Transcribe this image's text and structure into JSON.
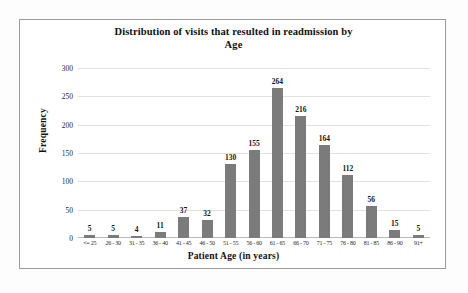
{
  "chart_data": {
    "type": "bar",
    "title": "Distribution of visits that resulted in readmission by Age",
    "title_line1": "Distribution of visits that resulted in readmission by",
    "title_line2": "Age",
    "xlabel": "Patient Age (in years)",
    "ylabel": "Frequency",
    "categories": [
      "<= 25",
      "26 - 30",
      "31 - 35",
      "36 - 40",
      "41 - 45",
      "46 - 50",
      "51 - 55",
      "56 - 60",
      "61 - 65",
      "66 - 70",
      "71 - 75",
      "76 - 80",
      "81 - 85",
      "86 - 90",
      "91+"
    ],
    "values": [
      5,
      5,
      4,
      11,
      37,
      32,
      130,
      155,
      264,
      216,
      164,
      112,
      56,
      15,
      5
    ],
    "ylim": [
      0,
      300
    ],
    "yticks": [
      0,
      50,
      100,
      150,
      200,
      250,
      300
    ],
    "grid": true,
    "legend": false,
    "bar_color": "#7b7b7b",
    "gridline_color": "#e2e2e2",
    "frame_color": "#9c9c9c",
    "background": "#ffffff"
  }
}
